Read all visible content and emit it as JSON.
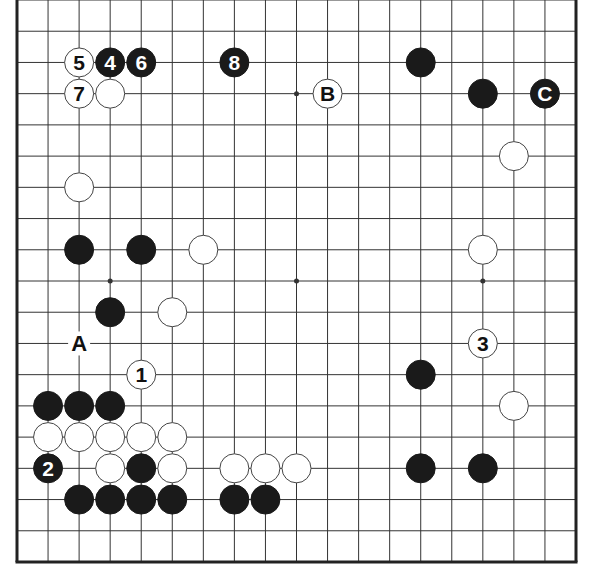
{
  "diagram": {
    "type": "go-board",
    "size": 19,
    "colors": {
      "background": "#ffffff",
      "line": "#333333",
      "edge": "#222222",
      "black_stone": "#1a1a1a",
      "white_stone": "#ffffff",
      "stone_outline": "#444444"
    },
    "star_points": [
      [
        9,
        3
      ],
      [
        3,
        9
      ],
      [
        9,
        9
      ],
      [
        15,
        9
      ]
    ],
    "stones": [
      {
        "col": 2,
        "row": 2,
        "color": "white",
        "label": "5"
      },
      {
        "col": 3,
        "row": 2,
        "color": "black",
        "label": "4"
      },
      {
        "col": 4,
        "row": 2,
        "color": "black",
        "label": "6"
      },
      {
        "col": 7,
        "row": 2,
        "color": "black",
        "label": "8"
      },
      {
        "col": 13,
        "row": 2,
        "color": "black",
        "label": ""
      },
      {
        "col": 2,
        "row": 3,
        "color": "white",
        "label": "7"
      },
      {
        "col": 3,
        "row": 3,
        "color": "white",
        "label": ""
      },
      {
        "col": 10,
        "row": 3,
        "color": "white",
        "label": "B"
      },
      {
        "col": 15,
        "row": 3,
        "color": "black",
        "label": ""
      },
      {
        "col": 17,
        "row": 3,
        "color": "black",
        "label": "C"
      },
      {
        "col": 16,
        "row": 5,
        "color": "white",
        "label": ""
      },
      {
        "col": 2,
        "row": 6,
        "color": "white",
        "label": ""
      },
      {
        "col": 2,
        "row": 8,
        "color": "black",
        "label": ""
      },
      {
        "col": 4,
        "row": 8,
        "color": "black",
        "label": ""
      },
      {
        "col": 6,
        "row": 8,
        "color": "white",
        "label": ""
      },
      {
        "col": 15,
        "row": 8,
        "color": "white",
        "label": ""
      },
      {
        "col": 3,
        "row": 10,
        "color": "black",
        "label": ""
      },
      {
        "col": 5,
        "row": 10,
        "color": "white",
        "label": ""
      },
      {
        "col": 15,
        "row": 11,
        "color": "white",
        "label": "3"
      },
      {
        "col": 4,
        "row": 12,
        "color": "white",
        "label": "1"
      },
      {
        "col": 13,
        "row": 12,
        "color": "black",
        "label": ""
      },
      {
        "col": 1,
        "row": 13,
        "color": "black",
        "label": ""
      },
      {
        "col": 2,
        "row": 13,
        "color": "black",
        "label": ""
      },
      {
        "col": 3,
        "row": 13,
        "color": "black",
        "label": ""
      },
      {
        "col": 16,
        "row": 13,
        "color": "white",
        "label": ""
      },
      {
        "col": 1,
        "row": 14,
        "color": "white",
        "label": ""
      },
      {
        "col": 2,
        "row": 14,
        "color": "white",
        "label": ""
      },
      {
        "col": 3,
        "row": 14,
        "color": "white",
        "label": ""
      },
      {
        "col": 4,
        "row": 14,
        "color": "white",
        "label": ""
      },
      {
        "col": 5,
        "row": 14,
        "color": "white",
        "label": ""
      },
      {
        "col": 1,
        "row": 15,
        "color": "black",
        "label": "2"
      },
      {
        "col": 3,
        "row": 15,
        "color": "white",
        "label": ""
      },
      {
        "col": 4,
        "row": 15,
        "color": "black",
        "label": ""
      },
      {
        "col": 5,
        "row": 15,
        "color": "white",
        "label": ""
      },
      {
        "col": 7,
        "row": 15,
        "color": "white",
        "label": ""
      },
      {
        "col": 8,
        "row": 15,
        "color": "white",
        "label": ""
      },
      {
        "col": 9,
        "row": 15,
        "color": "white",
        "label": ""
      },
      {
        "col": 13,
        "row": 15,
        "color": "black",
        "label": ""
      },
      {
        "col": 15,
        "row": 15,
        "color": "black",
        "label": ""
      },
      {
        "col": 2,
        "row": 16,
        "color": "black",
        "label": ""
      },
      {
        "col": 3,
        "row": 16,
        "color": "black",
        "label": ""
      },
      {
        "col": 4,
        "row": 16,
        "color": "black",
        "label": ""
      },
      {
        "col": 5,
        "row": 16,
        "color": "black",
        "label": ""
      },
      {
        "col": 7,
        "row": 16,
        "color": "black",
        "label": ""
      },
      {
        "col": 8,
        "row": 16,
        "color": "black",
        "label": ""
      }
    ],
    "point_labels": [
      {
        "col": 2,
        "row": 11,
        "label": "A"
      }
    ]
  }
}
